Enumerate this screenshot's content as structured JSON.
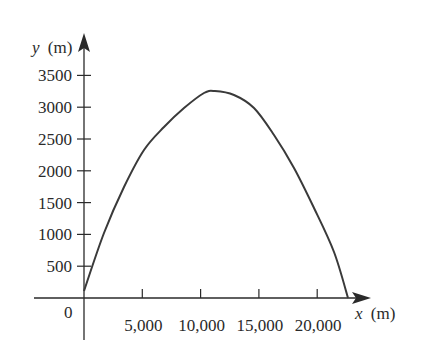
{
  "chart_data": {
    "type": "line",
    "title": "",
    "xlabel": "x (m)",
    "ylabel": "y (m)",
    "xlabel_var": "x",
    "ylabel_var": "y",
    "unit_label": "(m)",
    "origin_label": "0",
    "x_ticks": [
      5000,
      10000,
      15000,
      20000
    ],
    "x_tick_labels": [
      "5,000",
      "10,000",
      "15,000",
      "20,000"
    ],
    "y_ticks": [
      500,
      1000,
      1500,
      2000,
      2500,
      3000,
      3500
    ],
    "y_tick_labels": [
      "500",
      "1000",
      "1500",
      "2000",
      "2500",
      "3000",
      "3500"
    ],
    "xlim": [
      -4300,
      24800
    ],
    "ylim": [
      -700,
      4000
    ],
    "grid": false,
    "legend": null,
    "series": [
      {
        "name": "trajectory",
        "color": "#3a3a3a",
        "x": [
          0,
          1715,
          3430,
          5146,
          6861,
          8576,
          10290,
          11230,
          12864,
          14580,
          16295,
          18010,
          19725,
          21441,
          22640
        ],
        "y": [
          110,
          1022,
          1745,
          2327,
          2689,
          2987,
          3223,
          3255,
          3192,
          2987,
          2563,
          2044,
          1415,
          723,
          0
        ]
      }
    ]
  },
  "colors": {
    "axis": "#2a2a2a",
    "curve": "#3a3a3a",
    "background": "#ffffff"
  }
}
